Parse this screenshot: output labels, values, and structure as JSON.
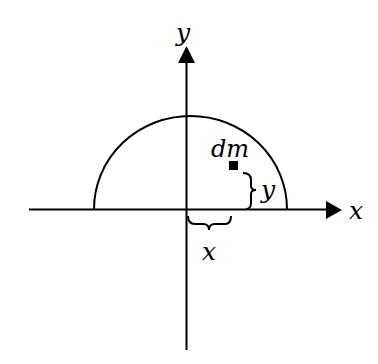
{
  "diagram": {
    "axes": {
      "x_label": "x",
      "y_label": "y"
    },
    "element_label": "dm",
    "brace_labels": {
      "horizontal": "x",
      "vertical": "y"
    },
    "colors": {
      "stroke": "#000000",
      "background": "#ffffff"
    }
  }
}
